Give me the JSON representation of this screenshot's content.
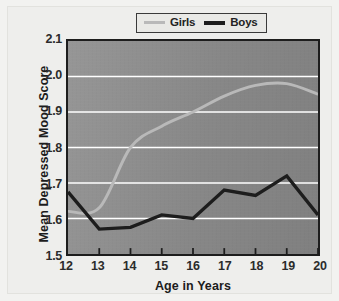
{
  "chart_data": {
    "type": "line",
    "title": "",
    "xlabel": "Age in Years",
    "ylabel": "Mean Depressed Mood Score",
    "x": [
      12,
      13,
      14,
      15,
      16,
      17,
      18,
      19,
      20
    ],
    "xticklabels": [
      "12",
      "13",
      "14",
      "15",
      "16",
      "17",
      "18",
      "19",
      "20"
    ],
    "yticklabels": [
      "1.5",
      "1.6",
      "1.7",
      "1.8",
      "1.9",
      "2.0",
      "2.1"
    ],
    "yticks": [
      1.5,
      1.6,
      1.7,
      1.8,
      1.9,
      2.0,
      2.1
    ],
    "xlim": [
      12,
      20
    ],
    "ylim": [
      1.5,
      2.1
    ],
    "grid": "horizontal",
    "legend_position": "top-right",
    "series": [
      {
        "name": "Girls",
        "color": "#b9b9b9",
        "values": [
          1.62,
          1.63,
          1.8,
          1.86,
          1.9,
          1.945,
          1.975,
          1.98,
          1.95
        ]
      },
      {
        "name": "Boys",
        "color": "#1d1d1d",
        "values": [
          1.675,
          1.57,
          1.575,
          1.61,
          1.6,
          1.68,
          1.665,
          1.72,
          1.61
        ]
      }
    ]
  },
  "legend": {
    "entries": [
      {
        "label": "Girls"
      },
      {
        "label": "Boys"
      }
    ]
  },
  "style": {
    "plot_background": "#8e8e8e",
    "gridline_color": "#ffffff",
    "axis_color": "#1d1d1d",
    "figure_background": "#f2f2f0"
  }
}
